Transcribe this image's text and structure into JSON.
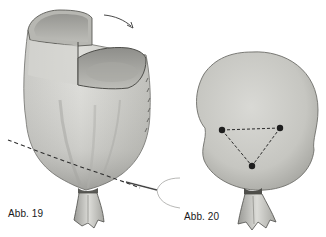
{
  "figures": [
    {
      "id": "fig19",
      "label": "Abb. 19",
      "description": "Fabric pouch being stuffed, top folded open, needle with thread sewing a running stitch across lower body; bottom gathered and tied with fabric tuft",
      "elements": [
        "folded-top-opening",
        "rotation-arrow",
        "dashed-stitch-line",
        "needle",
        "thread",
        "gathered-tie",
        "fabric-tuft"
      ]
    },
    {
      "id": "fig20",
      "label": "Abb. 20",
      "description": "Round stuffed head form with three stitch points connected in a dashed triangle; bottom gathered and tied with fabric tuft",
      "elements": [
        "round-head",
        "stitch-points-triangle",
        "gathered-tie",
        "fabric-tuft"
      ]
    }
  ],
  "colors": {
    "background": "#ffffff",
    "fabric_light": "#d8d8d4",
    "fabric_mid": "#b9b9b4",
    "fabric_dark": "#8a8a86",
    "outline": "#5a5a56",
    "stitch": "#2a2a2a",
    "label": "#1a1a1a"
  }
}
